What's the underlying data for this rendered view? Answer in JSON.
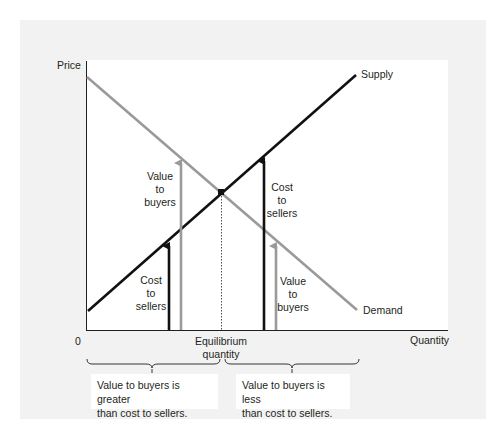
{
  "figure": {
    "axes": {
      "y_label": "Price",
      "x_label": "Quantity",
      "origin_label": "0",
      "equilibrium_label_line1": "Equilibrium",
      "equilibrium_label_line2": "quantity"
    },
    "curves": {
      "supply_label": "Supply",
      "demand_label": "Demand"
    },
    "left_side": {
      "value_arrow_label": [
        "Value",
        "to",
        "buyers"
      ],
      "cost_arrow_label": [
        "Cost",
        "to",
        "sellers"
      ]
    },
    "right_side": {
      "cost_arrow_label": [
        "Cost",
        "to",
        "sellers"
      ],
      "value_arrow_label": [
        "Value",
        "to",
        "buyers"
      ]
    },
    "notes": {
      "left_line1": "Value to buyers is greater",
      "left_line2": "than cost to sellers.",
      "right_line1": "Value to buyers is less",
      "right_line2": "than cost to sellers."
    },
    "colors": {
      "panel_bg": "#f2f2f2",
      "supply": "#111111",
      "demand": "#9a9a9a",
      "text": "#231f20"
    }
  }
}
